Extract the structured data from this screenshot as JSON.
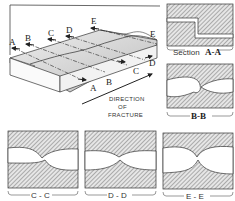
{
  "block": {
    "front_labels": [
      "A",
      "B",
      "C",
      "D",
      "E"
    ],
    "back_labels": [
      "A",
      "B",
      "C",
      "D",
      "E"
    ],
    "direction_caption": [
      "DIRECTION",
      "OF",
      "FRACTURE"
    ]
  },
  "sections": {
    "aa": {
      "prefix": "Section",
      "label": "A-A"
    },
    "bb": {
      "label": "B-B"
    },
    "cc": {
      "label": "C - C"
    },
    "dd": {
      "label": "D - D"
    },
    "ee": {
      "label": "E - E"
    }
  },
  "colors": {
    "ink": "#2a2a2a",
    "hatch": "#6e6e6e",
    "surface": "#d8d8d8",
    "paper": "#ffffff"
  }
}
